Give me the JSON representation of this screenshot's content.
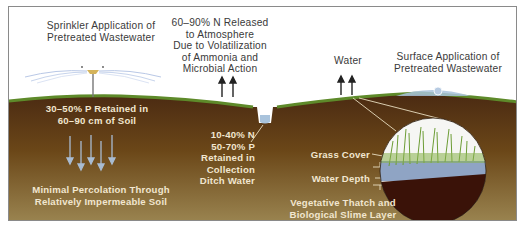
{
  "diagram": {
    "labels": {
      "sprinkler": [
        "Sprinkler Application of",
        "Pretreated Wastewater"
      ],
      "volatilization": [
        "60–90% N Released",
        "to Atmosphere",
        "Due to Volatilization",
        "of Ammonia and",
        "Microbial Action"
      ],
      "water": "Water",
      "surface": [
        "Surface Application of",
        "Pretreated Wastewater"
      ],
      "p_retained": [
        "30–50% P Retained in",
        "60–90 cm of Soil"
      ],
      "percolation": [
        "Minimal Percolation Through",
        "Relatively Impermeable Soil"
      ],
      "ditch_n": "10-40% N",
      "ditch_p": "50-70% P",
      "ditch_retained": [
        "Retained in",
        "Collection",
        "Ditch Water"
      ],
      "grass_cover": "Grass Cover",
      "water_depth": "Water Depth",
      "thatch": [
        "Vegetative Thatch and",
        "Biological Slime Layer"
      ]
    },
    "icons": {
      "sprinkler": "sprinkler-icon",
      "up_arrows": "arrow-up-icon",
      "down_arrows": "arrow-down-icon",
      "detail_circle": "magnified-soil-section"
    },
    "colors": {
      "soil_top": "#4a2a12",
      "soil_bottom": "#9a8450",
      "grass": "#5e8a2a",
      "water": "#a9c3dc",
      "circle_soil": "#3a1208",
      "label_dark": "#3a3a3a",
      "label_light": "#f1e6cf"
    }
  }
}
